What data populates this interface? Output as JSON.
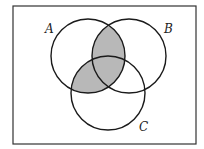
{
  "diagram": {
    "type": "venn",
    "sets": [
      {
        "name": "A",
        "cx": 88,
        "cy": 56,
        "r": 37,
        "label_x": 45,
        "label_y": 33
      },
      {
        "name": "B",
        "cx": 129,
        "cy": 56,
        "r": 37,
        "label_x": 164,
        "label_y": 33
      },
      {
        "name": "C",
        "cx": 108,
        "cy": 93,
        "r": 37,
        "label_x": 139,
        "label_y": 131
      }
    ],
    "shaded_region": "A ∩ (B ∪ C)",
    "frame": {
      "x": 13,
      "y": 6,
      "width": 183,
      "height": 138
    },
    "colors": {
      "shade": "#b8b8b8",
      "stroke": "#1a1a1a",
      "background": "#ffffff"
    }
  }
}
